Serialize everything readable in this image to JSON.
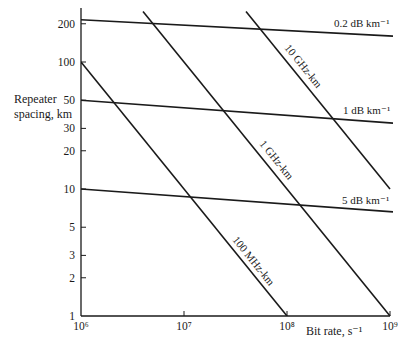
{
  "chart_data": {
    "type": "line",
    "title": "",
    "xlabel": "Bit rate, s⁻¹",
    "ylabel": "Repeater spacing, km",
    "xscale": "log",
    "yscale": "log",
    "xlim": [
      1000000,
      1000000000
    ],
    "ylim": [
      1,
      250
    ],
    "grid": false,
    "legend": "inline labels on lines",
    "x_ticks": [
      {
        "value": 1000000,
        "label": "10⁶"
      },
      {
        "value": 10000000,
        "label": "10⁷"
      },
      {
        "value": 100000000,
        "label": "10⁸"
      },
      {
        "value": 1000000000,
        "label": "10⁹"
      }
    ],
    "y_ticks": [
      {
        "value": 1,
        "label": "1"
      },
      {
        "value": 2,
        "label": "2"
      },
      {
        "value": 3,
        "label": "3"
      },
      {
        "value": 5,
        "label": "5"
      },
      {
        "value": 10,
        "label": "10"
      },
      {
        "value": 20,
        "label": "20"
      },
      {
        "value": 30,
        "label": "30"
      },
      {
        "value": 50,
        "label": "50"
      },
      {
        "value": 100,
        "label": "100"
      },
      {
        "value": 200,
        "label": "200"
      }
    ],
    "series": [
      {
        "name": "0.2 dB km⁻¹",
        "kind": "attenuation-limit",
        "x": [
          1000000,
          1000000000
        ],
        "y": [
          215,
          160
        ]
      },
      {
        "name": "1 dB km⁻¹",
        "kind": "attenuation-limit",
        "x": [
          1000000,
          1000000000
        ],
        "y": [
          50,
          33
        ]
      },
      {
        "name": "5 dB km⁻¹",
        "kind": "attenuation-limit",
        "x": [
          1000000,
          1000000000
        ],
        "y": [
          10,
          6.6
        ]
      },
      {
        "name": "100 MHz-km",
        "kind": "bandwidth-limit",
        "x": [
          1000000,
          100000000
        ],
        "y": [
          100,
          1
        ]
      },
      {
        "name": "1 GHz-km",
        "kind": "bandwidth-limit",
        "x": [
          4000000,
          1000000000
        ],
        "y": [
          250,
          1
        ]
      },
      {
        "name": "10 GHz-km",
        "kind": "bandwidth-limit",
        "x": [
          40000000,
          1000000000
        ],
        "y": [
          250,
          10
        ]
      }
    ]
  },
  "labels": {
    "ylabel_line1": "Repeater",
    "ylabel_line2": "spacing, km",
    "xlabel": "Bit rate, s⁻¹"
  }
}
